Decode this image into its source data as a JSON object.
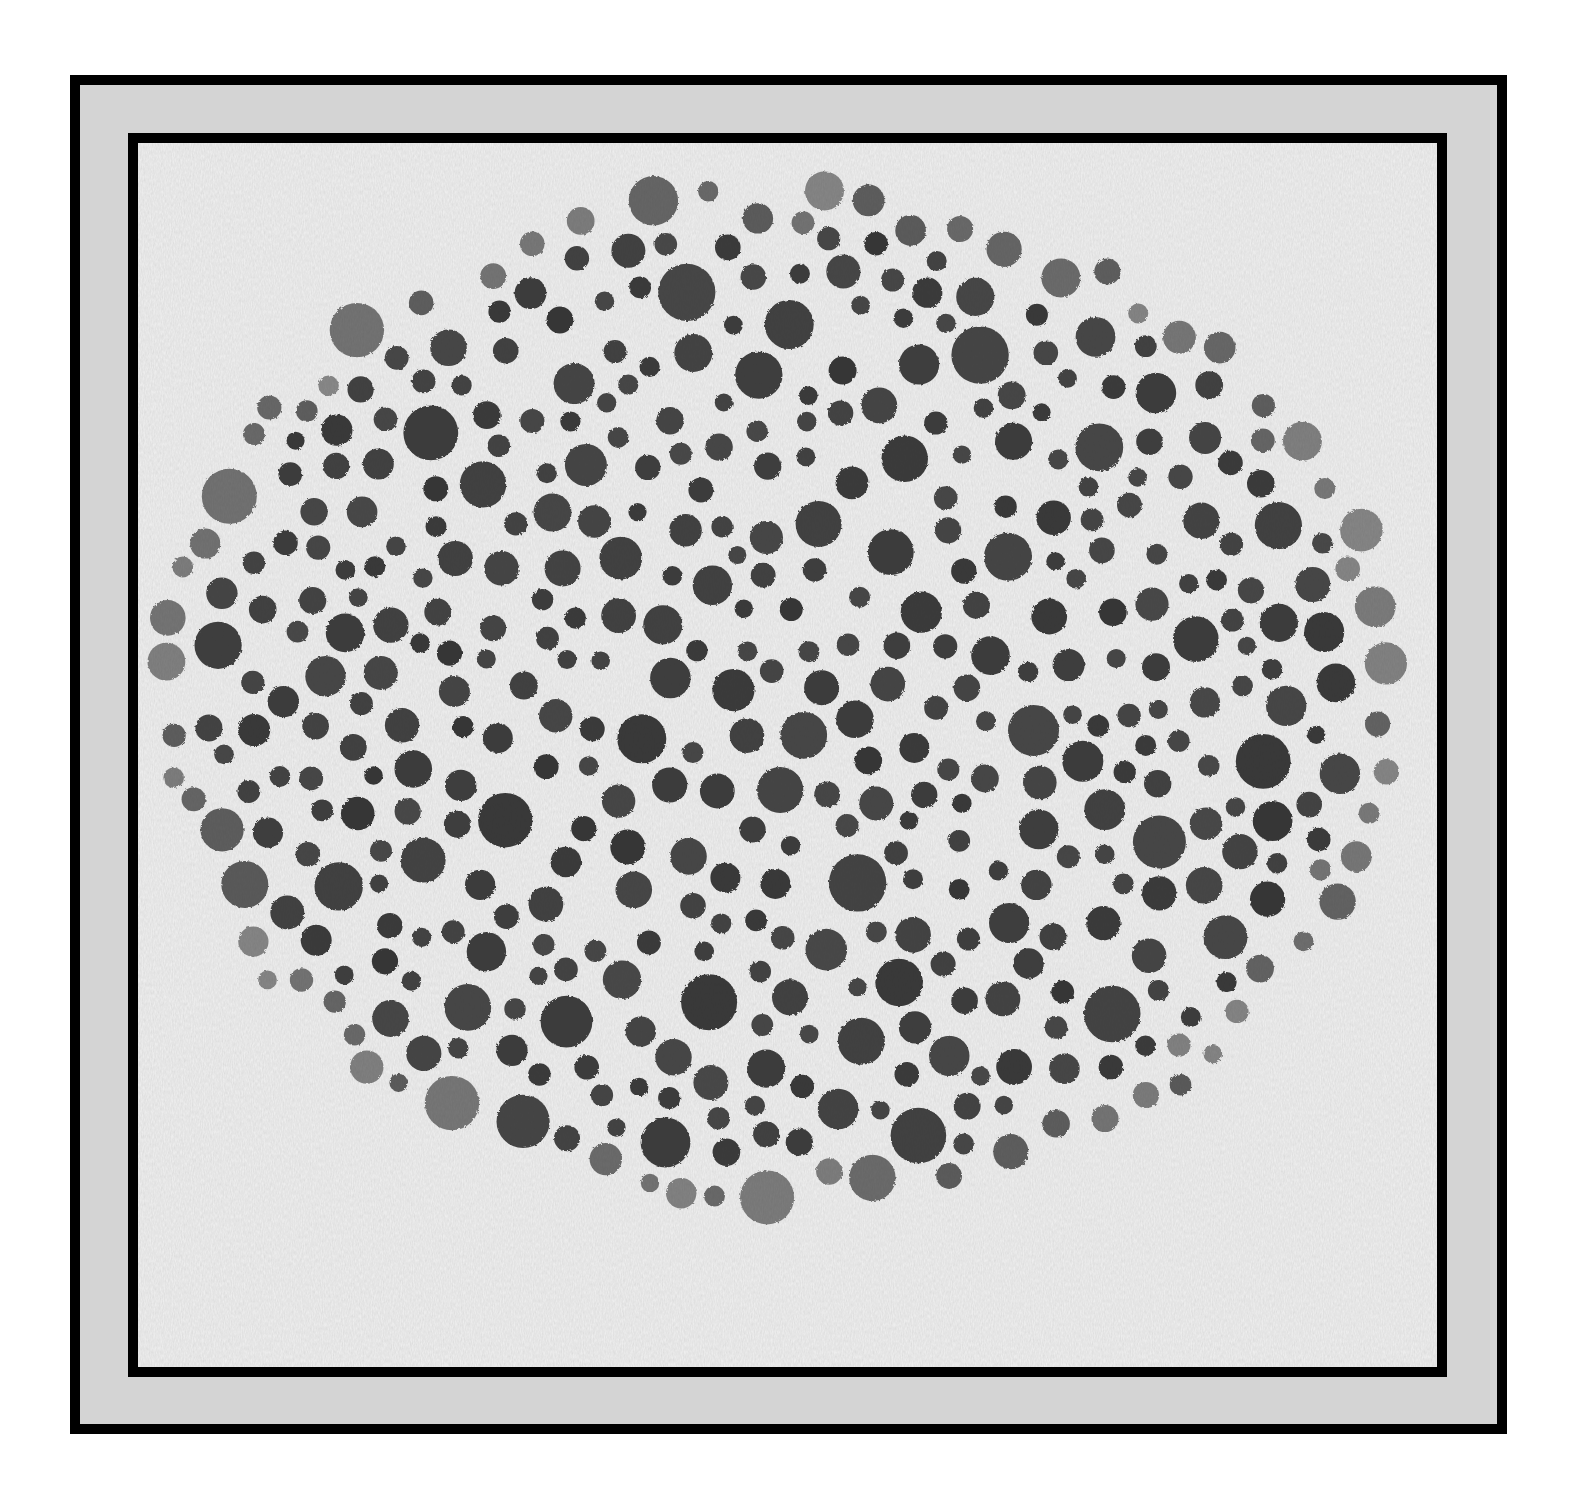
{
  "artwork": {
    "subject": "dot-pattern",
    "frame": {
      "outer_border_color": "#000000",
      "mat_color": "#d4d4d4",
      "inner_border_color": "#000000"
    },
    "photo": {
      "background_color": "#e4e4e4",
      "dot_color": "#333333",
      "dot_field": {
        "cx": 640,
        "cy": 555,
        "rx": 620,
        "ry": 510
      },
      "dot_count_approx": 520,
      "dot_diameter_range_px": [
        18,
        58
      ]
    }
  }
}
